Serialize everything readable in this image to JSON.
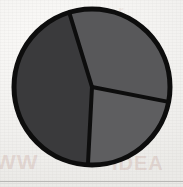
{
  "figure": {
    "kind": "pie-chart-figure",
    "width": 183,
    "height": 187,
    "background_color": "#f2f1ef",
    "caption": "",
    "title": ""
  },
  "chart_data": {
    "type": "pie",
    "title": "",
    "xlabel": "",
    "ylabel": "",
    "grid": false,
    "legend": "none",
    "labels_shown": false,
    "categories": [
      "Segment A",
      "Segment B",
      "Segment C"
    ],
    "values": [
      33.3,
      33.3,
      33.4
    ],
    "units": "percent",
    "total": 100,
    "start_angle_deg": -107,
    "direction": "clockwise",
    "slices": [
      {
        "name": "Segment A",
        "position": "top",
        "value": 33.3,
        "angle_deg": 118,
        "start_deg": -107,
        "end_deg": 11,
        "color": "#58585a",
        "label": ""
      },
      {
        "name": "Segment B",
        "position": "right",
        "value": 33.3,
        "angle_deg": 82,
        "start_deg": 11,
        "end_deg": 93,
        "color": "#5e5e60",
        "label": ""
      },
      {
        "name": "Segment C",
        "position": "lower-left",
        "value": 33.4,
        "angle_deg": 160,
        "start_deg": 93,
        "end_deg": 253,
        "color": "#3a3a3c",
        "label": ""
      }
    ],
    "geometry": {
      "center_x": 92,
      "center_y": 87,
      "radius": 78,
      "outline_color": "#0d0d0d",
      "outline_width": 5,
      "divider_color": "#0d0d0d",
      "divider_width": 4
    }
  },
  "artifacts": {
    "bleed_left_text": "WW",
    "bleed_right_text": "IDEA",
    "bleed_top_text": "r",
    "bleed_color": "#b0786e",
    "rule_color": "#b9b8b6"
  }
}
